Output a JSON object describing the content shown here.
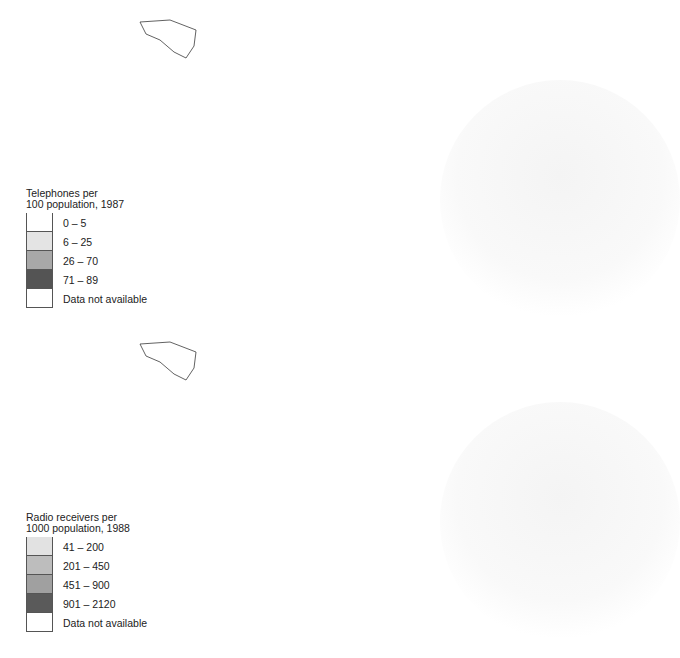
{
  "maps": [
    {
      "id": "telephones",
      "legend": {
        "title_line1": "Telephones per",
        "title_line2": "100 population, 1987",
        "classes": [
          {
            "label": "0 – 5",
            "color": "#ffffff"
          },
          {
            "label": "6 – 25",
            "color": "#e4e4e4"
          },
          {
            "label": "26 – 70",
            "color": "#a8a8a8"
          },
          {
            "label": "71 – 89",
            "color": "#545454"
          },
          {
            "label": "Data not available",
            "color": "#ffffff"
          }
        ]
      },
      "regions": {
        "north_america": "#545454",
        "greenland": "#ffffff",
        "mexico": "#e4e4e4",
        "central_america": "#e4e4e4",
        "caribbean": "#e4e4e4",
        "south_america_north": "#e4e4e4",
        "brazil": "#e4e4e4",
        "andes": "#ffffff",
        "southern_cone": "#e4e4e4",
        "western_europe": "#a8a8a8",
        "scandinavia": "#545454",
        "eastern_europe": "#e4e4e4",
        "ussr": "#e4e4e4",
        "north_africa": "#ffffff",
        "sub_saharan_africa": "#ffffff",
        "south_africa": "#e4e4e4",
        "madagascar": "#ffffff",
        "middle_east": "#e4e4e4",
        "iran_afghanistan": "#ffffff",
        "south_asia": "#ffffff",
        "mongolia": "#ffffff",
        "china": "#ffffff",
        "japan": "#a8a8a8",
        "korea": "#a8a8a8",
        "southeast_asia": "#ffffff",
        "indonesia": "#ffffff",
        "australia": "#a8a8a8",
        "new_zealand": "#a8a8a8",
        "iceland": "#a8a8a8",
        "uk": "#a8a8a8",
        "iberia": "#a8a8a8"
      }
    },
    {
      "id": "radios",
      "legend": {
        "title_line1": "Radio receivers per",
        "title_line2": "1000 population, 1988",
        "classes": [
          {
            "label": "41 – 200",
            "color": "#e2e2e2"
          },
          {
            "label": "201 – 450",
            "color": "#bdbdbd"
          },
          {
            "label": "451 – 900",
            "color": "#a0a0a0"
          },
          {
            "label": "901 – 2120",
            "color": "#5a5a5a"
          },
          {
            "label": "Data not available",
            "color": "#ffffff"
          }
        ]
      },
      "regions": {
        "north_america": "#5a5a5a",
        "greenland": "#ffffff",
        "mexico": "#bdbdbd",
        "central_america": "#bdbdbd",
        "caribbean": "#bdbdbd",
        "south_america_north": "#e2e2e2",
        "brazil": "#a0a0a0",
        "andes": "#bdbdbd",
        "southern_cone": "#a0a0a0",
        "western_europe": "#a0a0a0",
        "scandinavia": "#5a5a5a",
        "eastern_europe": "#a0a0a0",
        "ussr": "#a0a0a0",
        "north_africa": "#a0a0a0",
        "sub_saharan_africa": "#ffffff",
        "south_africa": "#a0a0a0",
        "madagascar": "#e2e2e2",
        "middle_east": "#a0a0a0",
        "iran_afghanistan": "#a0a0a0",
        "south_asia": "#e2e2e2",
        "mongolia": "#ffffff",
        "china": "#e2e2e2",
        "japan": "#5a5a5a",
        "korea": "#a0a0a0",
        "southeast_asia": "#e2e2e2",
        "indonesia": "#e2e2e2",
        "australia": "#5a5a5a",
        "new_zealand": "#5a5a5a",
        "iceland": "#a0a0a0",
        "uk": "#5a5a5a",
        "iberia": "#a0a0a0"
      }
    }
  ]
}
